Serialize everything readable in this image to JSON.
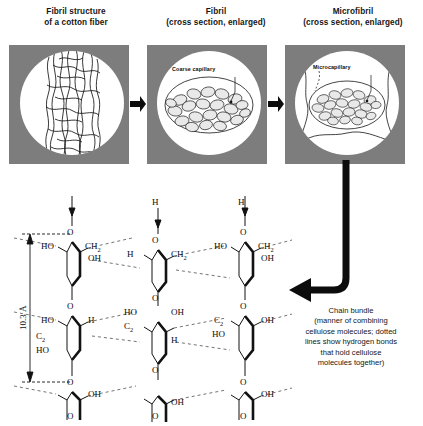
{
  "figure": {
    "type": "scientific-diagram",
    "background": "#ffffff",
    "panel_fill": "#7d7d7d",
    "ink": "#111111"
  },
  "panels": [
    {
      "id": "fibril-structure",
      "title_line1": "Fibril structure",
      "title_line2": "of a cotton fiber",
      "inner_label": ""
    },
    {
      "id": "fibril-cross-section",
      "title_line1": "Fibril",
      "title_line2": "(cross section, enlarged)",
      "inner_label": "Coarse capillary"
    },
    {
      "id": "microfibril-cross-section",
      "title_line1": "Microfibril",
      "title_line2": "(cross section, enlarged)",
      "inner_label": "Microcapillary"
    }
  ],
  "dimension": {
    "value": "10.3",
    "unit": "Å",
    "label": "10.3 Å"
  },
  "caption": {
    "lines": [
      "Chain bundle",
      "(manner of combining",
      "cellulose molecules; dotted",
      "lines show hydrogen bonds",
      "that hold cellulose",
      "molecules together)"
    ]
  },
  "chem_labels": {
    "c1": "O",
    "c2": "HO",
    "c3": "CH",
    "c3s": "2",
    "c4": "OH",
    "c5": "O",
    "c6": "HO",
    "c7": "H",
    "c8": "O",
    "c9": "H",
    "c10": "O",
    "c11": "CH",
    "c11s": "2",
    "c12": "O",
    "c13": "OH",
    "c14": "O",
    "c15": "O",
    "c16": "HO",
    "c17": "CH",
    "c17s": "2",
    "c18": "OH",
    "c19": "O",
    "c20": "O",
    "c21": "H",
    "c22": "O",
    "c23": "H",
    "c24": "C",
    "c24s": "2",
    "c25": "HO",
    "c26": "O",
    "c27": "H",
    "c28": "O",
    "c29": "OH",
    "c30": "O",
    "c31": "HO",
    "c32": "H",
    "c32s": "2",
    "c33": "C",
    "c34": "O",
    "c35": "H",
    "c36": "O",
    "c37": "O",
    "c38": "OH",
    "c39": "H",
    "c40": "O",
    "c41": "H",
    "c41s": "2",
    "c42": "C",
    "c43": "OH",
    "c44": "HO",
    "c45": "O",
    "c46": "OH",
    "c47": "O"
  }
}
